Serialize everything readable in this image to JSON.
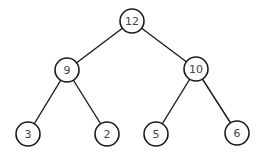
{
  "diagram": {
    "type": "binary-tree",
    "nodes": [
      {
        "id": "n12",
        "label": "12",
        "x": 132,
        "y": 21
      },
      {
        "id": "n9",
        "label": "9",
        "x": 67,
        "y": 70
      },
      {
        "id": "n10",
        "label": "10",
        "x": 196,
        "y": 69
      },
      {
        "id": "n3",
        "label": "3",
        "x": 28,
        "y": 134
      },
      {
        "id": "n2",
        "label": "2",
        "x": 107,
        "y": 134
      },
      {
        "id": "n5",
        "label": "5",
        "x": 156,
        "y": 134
      },
      {
        "id": "n6",
        "label": "6",
        "x": 237,
        "y": 133
      }
    ],
    "edges": [
      {
        "from": "n12",
        "to": "n9"
      },
      {
        "from": "n12",
        "to": "n10"
      },
      {
        "from": "n9",
        "to": "n3"
      },
      {
        "from": "n9",
        "to": "n2"
      },
      {
        "from": "n10",
        "to": "n5"
      },
      {
        "from": "n10",
        "to": "n6"
      }
    ],
    "node_radius": 12,
    "colors": {
      "stroke": "#1a1a1a",
      "fill": "#ffffff",
      "text": "#444444",
      "background": "#ffffff"
    }
  }
}
